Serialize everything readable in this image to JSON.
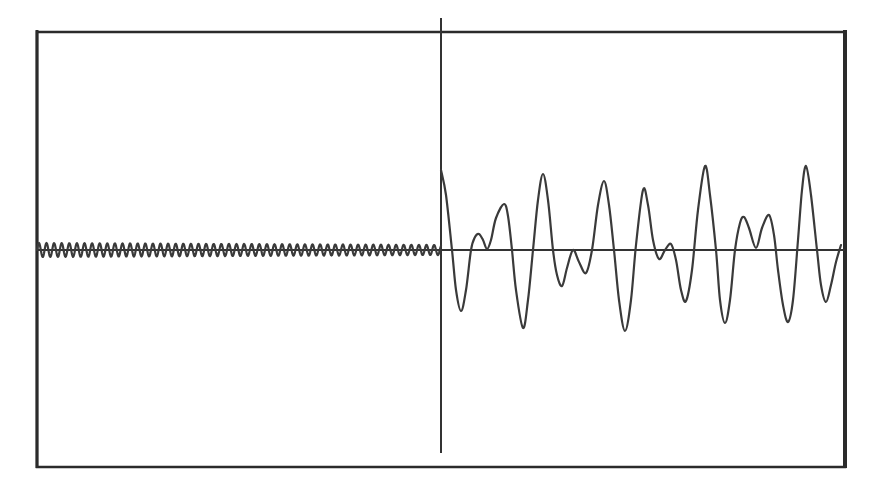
{
  "chart_data": {
    "type": "line",
    "title": "",
    "xlabel": "",
    "ylabel": "",
    "grid": false,
    "legend": null,
    "colors": {
      "background": "#ffffff",
      "line": "#3a3a3a",
      "frame": "#2b2b2b"
    },
    "frame_px": {
      "left": 37,
      "top": 32,
      "right": 845,
      "bottom": 467
    },
    "baseline_y_px": 250,
    "marker_x_px": 441,
    "marker_y_range_px": [
      18,
      453
    ],
    "segments": [
      {
        "name": "pre-marker small oscillation",
        "x_range_px": [
          37,
          441
        ],
        "period_px": 7.6,
        "amplitude_px_start": 7,
        "amplitude_px_end": 5,
        "description": "Fast, low-amplitude near-sinusoidal ripple around baseline"
      },
      {
        "name": "post-marker large waveform",
        "x_range_px": [
          441,
          841
        ],
        "description": "Irregular large-amplitude oscillation (beat-like) around baseline",
        "points_px": [
          [
            441,
            170
          ],
          [
            446,
            195
          ],
          [
            452,
            250
          ],
          [
            456,
            290
          ],
          [
            461,
            311
          ],
          [
            466,
            290
          ],
          [
            471,
            250
          ],
          [
            475,
            237
          ],
          [
            479,
            234
          ],
          [
            483,
            240
          ],
          [
            487,
            249
          ],
          [
            491,
            240
          ],
          [
            496,
            218
          ],
          [
            504,
            204
          ],
          [
            508,
            216
          ],
          [
            512,
            250
          ],
          [
            516,
            290
          ],
          [
            523,
            328
          ],
          [
            528,
            300
          ],
          [
            533,
            250
          ],
          [
            538,
            200
          ],
          [
            543,
            174
          ],
          [
            548,
            200
          ],
          [
            553,
            250
          ],
          [
            557,
            275
          ],
          [
            562,
            286
          ],
          [
            567,
            268
          ],
          [
            573,
            250
          ],
          [
            579,
            262
          ],
          [
            586,
            273
          ],
          [
            592,
            250
          ],
          [
            598,
            205
          ],
          [
            604,
            181
          ],
          [
            609,
            205
          ],
          [
            614,
            250
          ],
          [
            619,
            300
          ],
          [
            625,
            331
          ],
          [
            631,
            300
          ],
          [
            636,
            245
          ],
          [
            643,
            190
          ],
          [
            648,
            205
          ],
          [
            653,
            240
          ],
          [
            659,
            259
          ],
          [
            665,
            250
          ],
          [
            671,
            244
          ],
          [
            676,
            260
          ],
          [
            681,
            290
          ],
          [
            686,
            301
          ],
          [
            692,
            270
          ],
          [
            698,
            210
          ],
          [
            705,
            166
          ],
          [
            710,
            195
          ],
          [
            716,
            250
          ],
          [
            720,
            300
          ],
          [
            725,
            323
          ],
          [
            730,
            300
          ],
          [
            735,
            250
          ],
          [
            740,
            223
          ],
          [
            744,
            217
          ],
          [
            749,
            228
          ],
          [
            756,
            248
          ],
          [
            762,
            228
          ],
          [
            769,
            215
          ],
          [
            774,
            235
          ],
          [
            778,
            270
          ],
          [
            783,
            305
          ],
          [
            788,
            322
          ],
          [
            793,
            300
          ],
          [
            798,
            240
          ],
          [
            802,
            190
          ],
          [
            806,
            166
          ],
          [
            811,
            195
          ],
          [
            817,
            250
          ],
          [
            821,
            285
          ],
          [
            826,
            302
          ],
          [
            831,
            285
          ],
          [
            836,
            262
          ],
          [
            841,
            245
          ]
        ]
      }
    ]
  }
}
